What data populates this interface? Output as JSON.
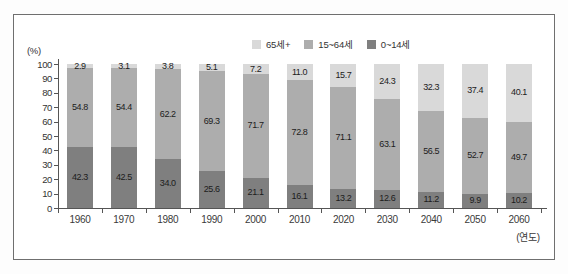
{
  "window": {
    "background": "#ffffff",
    "frame_border_color": "#6f6f6f"
  },
  "chart_data": {
    "type": "bar",
    "stacked": true,
    "title": "",
    "unit_label": "(%)",
    "x_axis_note": "(연도)",
    "categories": [
      "1960",
      "1970",
      "1980",
      "1990",
      "2000",
      "2010",
      "2020",
      "2030",
      "2040",
      "2050",
      "2060"
    ],
    "series": [
      {
        "name": "0~14세",
        "color": "#7f7f7f",
        "values": [
          42.3,
          42.5,
          34.0,
          25.6,
          21.1,
          16.1,
          13.2,
          12.6,
          11.2,
          9.9,
          10.2
        ]
      },
      {
        "name": "15~64세",
        "color": "#adadad",
        "values": [
          54.8,
          54.4,
          62.2,
          69.3,
          71.7,
          72.8,
          71.1,
          63.1,
          56.5,
          52.7,
          49.7
        ]
      },
      {
        "name": "65세+",
        "color": "#d9d9d9",
        "values": [
          2.9,
          3.1,
          3.8,
          5.1,
          7.2,
          11.0,
          15.7,
          24.3,
          32.3,
          37.4,
          40.1
        ]
      }
    ],
    "y_ticks": [
      0,
      10,
      20,
      30,
      40,
      50,
      60,
      70,
      80,
      90,
      100
    ],
    "ylim": [
      0,
      100
    ],
    "value_labels": true,
    "value_label_decimals": 1,
    "legend_position": "top-center",
    "legend_order": [
      "65세+",
      "15~64세",
      "0~14세"
    ],
    "grid": false,
    "axis_color": "#555555",
    "text_color": "#333333"
  }
}
